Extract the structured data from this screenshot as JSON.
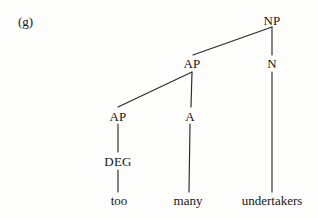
{
  "figure": {
    "example_label": "(g)",
    "type": "syntax-tree",
    "line_color": "#2a2a2a",
    "text_color": "#161616",
    "background_color": "#fdfdfb"
  },
  "tree": {
    "nodes": [
      {
        "id": "np",
        "label": "NP",
        "level": 0,
        "x": 272,
        "y": 20
      },
      {
        "id": "ap2",
        "label": "AP",
        "level": 1,
        "x": 192,
        "y": 63
      },
      {
        "id": "n",
        "label": "N",
        "level": 1,
        "x": 272,
        "y": 63
      },
      {
        "id": "ap1",
        "label": "AP",
        "level": 2,
        "x": 118,
        "y": 116
      },
      {
        "id": "a",
        "label": "A",
        "level": 2,
        "x": 190,
        "y": 116
      },
      {
        "id": "deg",
        "label": "DEG",
        "level": 3,
        "x": 118,
        "y": 161
      }
    ],
    "leaves": [
      {
        "id": "too",
        "label": "too",
        "x": 119,
        "y": 200
      },
      {
        "id": "many",
        "label": "many",
        "x": 188,
        "y": 200
      },
      {
        "id": "undertakers",
        "label": "undertakers",
        "x": 272,
        "y": 200
      }
    ],
    "edges": [
      {
        "from": "np",
        "to": "ap2",
        "x1": 272,
        "y1": 27,
        "x2": 193,
        "y2": 55
      },
      {
        "from": "np",
        "to": "n",
        "x1": 272,
        "y1": 27,
        "x2": 272,
        "y2": 55
      },
      {
        "from": "ap2",
        "to": "ap1",
        "x1": 192,
        "y1": 72,
        "x2": 118,
        "y2": 107
      },
      {
        "from": "ap2",
        "to": "a",
        "x1": 192,
        "y1": 72,
        "x2": 191,
        "y2": 107
      },
      {
        "from": "ap1",
        "to": "deg",
        "x1": 118,
        "y1": 124,
        "x2": 118,
        "y2": 152
      },
      {
        "from": "a",
        "to": "many",
        "x1": 190,
        "y1": 124,
        "x2": 189,
        "y2": 192
      },
      {
        "from": "n",
        "to": "undertakers",
        "x1": 272,
        "y1": 72,
        "x2": 272,
        "y2": 192
      },
      {
        "from": "deg",
        "to": "too",
        "x1": 118,
        "y1": 170,
        "x2": 118,
        "y2": 192
      }
    ]
  }
}
